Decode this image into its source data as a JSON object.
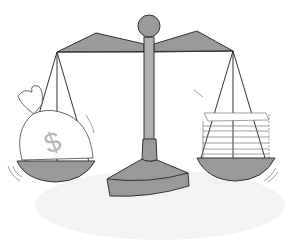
{
  "illustration": {
    "title": "Balance scale weighing a money bag against a stack of papers",
    "left_pan": {
      "content": "money bag",
      "symbol": "$"
    },
    "right_pan": {
      "content": "stack of papers"
    },
    "colors": {
      "metal_fill": "#9a9a9a",
      "metal_dark": "#8a8a8a",
      "outline": "#333333",
      "shadow": "#f0f0f0",
      "dollar": "#b5b5b5"
    }
  }
}
